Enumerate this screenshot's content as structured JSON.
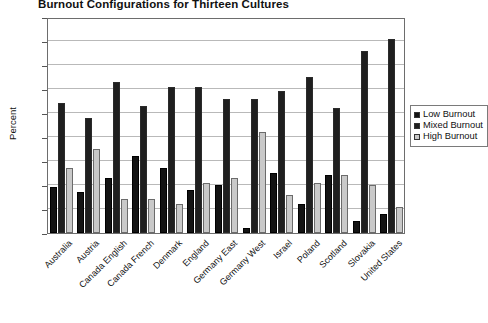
{
  "chart_data": {
    "type": "bar",
    "title": "Burnout Configurations for Thirteen Cultures",
    "xlabel": "",
    "ylabel": "Percent",
    "ylim": [
      0,
      90
    ],
    "yticks": [
      0,
      10,
      20,
      30,
      40,
      50,
      60,
      70,
      80,
      90
    ],
    "grid": true,
    "legend_position": "right",
    "categories": [
      "Australia",
      "Austria",
      "Canada English",
      "Canada French",
      "Denmark",
      "England",
      "Germany East",
      "Germany West",
      "Israel",
      "Poland",
      "Scotland",
      "Slovakia",
      "United States"
    ],
    "series": [
      {
        "name": "Low Burnout",
        "color": "#131313",
        "values": [
          19,
          17,
          23,
          32,
          27,
          18,
          20,
          2,
          25,
          12,
          24,
          5,
          8
        ]
      },
      {
        "name": "Mixed Burnout",
        "color": "#9e9e9e",
        "values": [
          54,
          48,
          63,
          53,
          61,
          61,
          56,
          56,
          59,
          65,
          52,
          76,
          81
        ]
      },
      {
        "name": "High Burnout",
        "color": "#c9c9c9",
        "values": [
          27,
          35,
          14,
          14,
          12,
          21,
          23,
          42,
          16,
          21,
          24,
          20,
          11
        ]
      }
    ]
  },
  "legend": {
    "items": [
      {
        "label": "Low Burnout"
      },
      {
        "label": "Mixed Burnout"
      },
      {
        "label": "High Burnout"
      }
    ]
  }
}
